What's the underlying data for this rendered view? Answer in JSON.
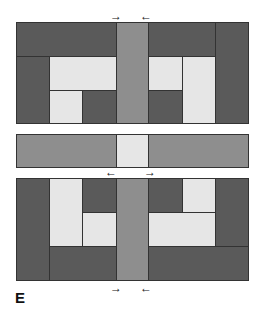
{
  "figure": {
    "label": "E",
    "colors": {
      "dark": "#5a5a5a",
      "medium": "#8e8e8e",
      "light": "#e6e6e6"
    },
    "arrows": {
      "top": [
        "→",
        "←"
      ],
      "middle": [
        "←",
        "→"
      ],
      "bottom": [
        "→",
        "←"
      ]
    },
    "panels": [
      "top-block-arrangement",
      "middle-strip",
      "bottom-block-arrangement"
    ]
  }
}
